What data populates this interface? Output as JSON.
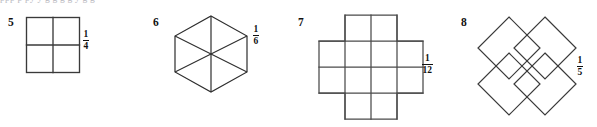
{
  "page": {
    "clipped_text_row": "ppp     p   py      y   g               g   g  g   y     g   g",
    "background_color": "#ffffff",
    "stroke_color": "#3a3a3a",
    "text_color": "#111111"
  },
  "problems": [
    {
      "number": "5",
      "figure_name": "square-divided-in-quarters",
      "figure_description": "square divided into four equal smaller squares by one vertical and one horizontal line",
      "parts": 4,
      "fraction": {
        "numerator": "1",
        "denominator": "4"
      }
    },
    {
      "number": "6",
      "figure_name": "hexagon-divided-in-sixths",
      "figure_description": "regular hexagon with pointed top and bottom divided into six triangles by three long diagonals",
      "parts": 6,
      "fraction": {
        "numerator": "1",
        "denominator": "6"
      }
    },
    {
      "number": "7",
      "figure_name": "cross-of-twelve-squares",
      "figure_description": "plus or cross shape made of twelve unit squares: a four by two middle band with two squares above and two squares below",
      "parts": 12,
      "fraction": {
        "numerator": "1",
        "denominator": "12"
      }
    },
    {
      "number": "8",
      "figure_name": "four-overlapping-diamonds",
      "figure_description": "four diamonds arranged in an X with a shared overlapping square in the centre, forming five regions",
      "parts": 5,
      "fraction": {
        "numerator": "1",
        "denominator": "5"
      }
    }
  ]
}
